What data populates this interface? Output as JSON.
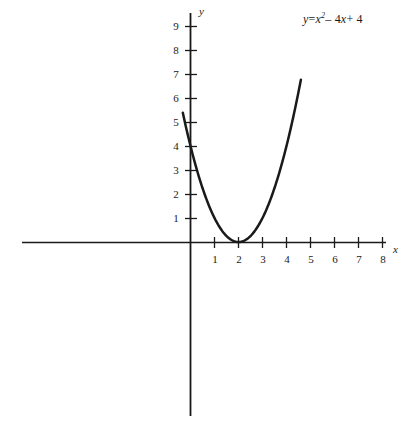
{
  "figure": {
    "title": "",
    "equation_label": "y = x² – 4x + 4",
    "equation_parts": {
      "lhs": "y",
      "equals": "=",
      "var": "x",
      "exponent": "2",
      "minus": "– 4",
      "var2": "x",
      "plus": "+ 4"
    },
    "axis_names": {
      "x": "x",
      "y": "y"
    },
    "stroke_color": "#1a1a1a",
    "background_color": "#ffffff"
  },
  "chart_data": {
    "type": "line",
    "title": "",
    "xlabel": "x",
    "ylabel": "y",
    "equation": "y = x^2 - 4x + 4",
    "function": "quadratic",
    "coefficients": {
      "a": 1,
      "b": -4,
      "c": 4
    },
    "vertex": [
      2,
      0
    ],
    "y_intercept": 4,
    "roots": [
      2
    ],
    "grid": false,
    "legend": "none",
    "annotations": [
      "y = x² – 4x + 4"
    ],
    "xlim": [
      -7,
      8.5
    ],
    "ylim": [
      -7.5,
      9.8
    ],
    "x_ticks": [
      1,
      2,
      3,
      4,
      5,
      6,
      7,
      8
    ],
    "x_tick_labels": [
      "1",
      "2",
      "3",
      "4",
      "5",
      "6",
      "7",
      "8"
    ],
    "y_ticks": [
      1,
      2,
      3,
      4,
      5,
      6,
      7,
      8,
      9
    ],
    "y_tick_labels": [
      "1",
      "2",
      "3",
      "4",
      "5",
      "6",
      "7",
      "8",
      "9"
    ],
    "x_domain_drawn": [
      -0.32,
      4.6
    ],
    "series": [
      {
        "name": "y = x^2 - 4x + 4",
        "x": [
          -0.32,
          -0.1,
          0.1,
          0.3,
          0.5,
          0.7,
          0.9,
          1.1,
          1.3,
          1.5,
          1.7,
          1.9,
          2.0,
          2.1,
          2.3,
          2.5,
          2.7,
          2.9,
          3.1,
          3.3,
          3.5,
          3.7,
          3.9,
          4.1,
          4.3,
          4.45,
          4.6
        ],
        "y": [
          5.38,
          4.41,
          3.61,
          2.89,
          2.25,
          1.69,
          1.21,
          0.81,
          0.49,
          0.25,
          0.09,
          0.01,
          0.0,
          0.01,
          0.09,
          0.25,
          0.49,
          0.81,
          1.21,
          1.69,
          2.25,
          2.89,
          3.61,
          4.41,
          5.29,
          6.0,
          6.76
        ]
      }
    ]
  }
}
